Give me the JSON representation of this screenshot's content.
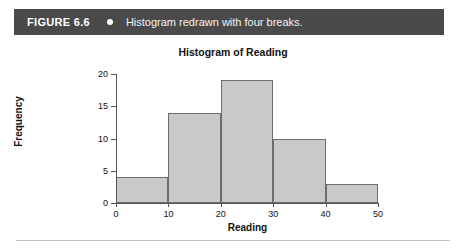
{
  "figure": {
    "label": "FIGURE 6.6",
    "bullet_icon": "bullet-dot-icon",
    "caption": "Histogram redrawn with four breaks.",
    "header_bg": "#4a4a4a",
    "header_text_color": "#ffffff"
  },
  "chart_data": {
    "type": "bar",
    "title": "Histogram of Reading",
    "xlabel": "Reading",
    "ylabel": "Frequency",
    "categories": [
      "0-10",
      "10-20",
      "20-30",
      "30-40",
      "40-50"
    ],
    "bin_edges": [
      0,
      10,
      20,
      30,
      40,
      50
    ],
    "values": [
      4,
      14,
      19,
      10,
      3
    ],
    "xlim": [
      0,
      50
    ],
    "ylim": [
      0,
      20
    ],
    "xticks": [
      0,
      10,
      20,
      30,
      40,
      50
    ],
    "yticks": [
      0,
      5,
      10,
      15,
      20
    ],
    "xtick_labels": [
      "0",
      "10",
      "20",
      "30",
      "40",
      "50"
    ],
    "ytick_labels": [
      "0",
      "5",
      "10",
      "15",
      "20"
    ],
    "grid": false,
    "legend": false,
    "bar_fill_color": "#c9c9c9",
    "bar_border_color": "#6d6d6d",
    "axis_color": "#555555"
  }
}
